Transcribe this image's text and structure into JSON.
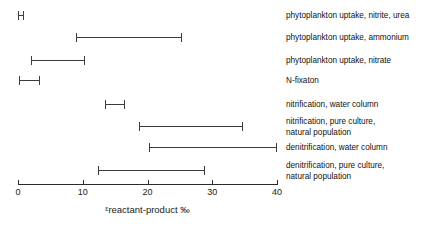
{
  "chart_data": {
    "type": "bar",
    "subtype": "horizontal-range-interval",
    "title": "",
    "subtitle": "",
    "xlabel": "εreactant-product ‰",
    "xlabel_parts": {
      "epsilon": "ε",
      "subscript_text": "reactant-product",
      "unit": "‰"
    },
    "ylabel": "",
    "xlim": [
      0,
      40
    ],
    "xticks": [
      0,
      10,
      20,
      30,
      40
    ],
    "xtick_labels": [
      "0",
      "10",
      "20",
      "30",
      "40"
    ],
    "grid": false,
    "legend": false,
    "legend_position": "none",
    "line_color": "#3c3c3c",
    "axis_color": "#2b2b2b",
    "categories": [
      "phytoplankton uptake, nitrite, urea",
      "phytoplankton uptake, ammonium",
      "phytoplankton uptake, nitrate",
      "N-fixaton",
      "nitrification, water column",
      "nitrification, pure culture,\nnatural population",
      "denitrification, water column",
      "denitrification, pure culture,\nnatural population"
    ],
    "ranges": [
      {
        "label": "phytoplankton uptake, nitrite, urea",
        "low": 0.0,
        "high": 1.0
      },
      {
        "label": "phytoplankton uptake, ammonium",
        "low": 9.0,
        "high": 25.3
      },
      {
        "label": "phytoplankton uptake, nitrate",
        "low": 2.0,
        "high": 10.4
      },
      {
        "label": "N-fixaton",
        "low": 0.2,
        "high": 3.4
      },
      {
        "label": "nitrification, water column",
        "low": 13.4,
        "high": 16.5
      },
      {
        "label": "nitrification, pure culture,\nnatural population",
        "low": 18.7,
        "high": 34.8
      },
      {
        "label": "denitrification, water column",
        "low": 20.2,
        "high": 40.0
      },
      {
        "label": "denitrification, pure culture,\nnatural population",
        "low": 12.4,
        "high": 28.9
      }
    ]
  },
  "axis": {
    "tick_0": "0",
    "tick_1": "10",
    "tick_2": "20",
    "tick_3": "30",
    "tick_4": "40",
    "title_epsilon": "ε",
    "title_main": "reactant-product",
    "title_unit": "‰"
  },
  "labels": {
    "row_0": "phytoplankton uptake, nitrite, urea",
    "row_1": "phytoplankton uptake, ammonium",
    "row_2": "phytoplankton uptake, nitrate",
    "row_3": "N-fixaton",
    "row_4": "nitrification, water column",
    "row_5": "nitrification, pure culture,\nnatural population",
    "row_6": "denitrification, water column",
    "row_7": "denitrification, pure culture,\nnatural population"
  }
}
